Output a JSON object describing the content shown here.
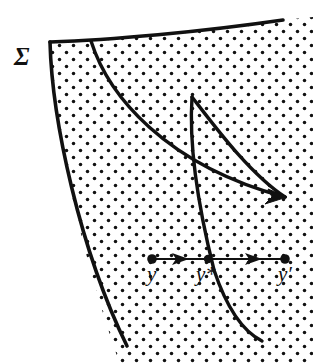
{
  "figure": {
    "kind": "mathematical-diagram",
    "caption_labels": {
      "surface": "Σ",
      "point_start": "y",
      "point_middle": "y*",
      "point_end": "y′"
    },
    "colors": {
      "ink": "#111111",
      "background": "#ffffff",
      "stipple": "#111111"
    },
    "stipple": {
      "dot_radius": 1.7,
      "spacing_x": 14,
      "spacing_y": 14,
      "stagger": true
    },
    "geometry": {
      "boundary_top": "M 50 42 C 110 40 200 32 283 20",
      "boundary_left": "M 50 42 C 52 120 80 250 127 346",
      "curve_inner_left": "M 91 41 C 108 95 165 165 283 198",
      "curve_cusp_upper": "M 192 97 C 216 128 250 172 283 197",
      "curve_cusp_lower": "M 192 97 C 190 140 198 200 215 272 C 232 318 248 334 262 341",
      "arrow_axis_y": 259,
      "arrow_x_start": 152,
      "arrow_x_mid": 208,
      "arrow_x_end": 285,
      "node_radius": 4.5,
      "flow_arrow_tip": [
        285,
        197
      ]
    }
  }
}
